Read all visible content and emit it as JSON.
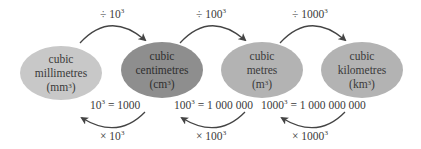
{
  "units": [
    {
      "id": "mm3",
      "line1": "cubic",
      "line2": "millimetres",
      "abbr": "mm",
      "exp": "3",
      "color": "#c8c8c8"
    },
    {
      "id": "cm3",
      "line1": "cubic",
      "line2": "centimetres",
      "abbr": "cm",
      "exp": "3",
      "color": "#8e8e8e"
    },
    {
      "id": "m3",
      "line1": "cubic",
      "line2": "metres",
      "abbr": "m",
      "exp": "3",
      "color": "#b3b3b3"
    },
    {
      "id": "km3",
      "line1": "cubic",
      "line2": "kilometres",
      "abbr": "km",
      "exp": "3",
      "color": "#b3b3b3"
    }
  ],
  "divide_labels": [
    {
      "op": "÷ 10",
      "exp": "3"
    },
    {
      "op": "÷ 100",
      "exp": "3"
    },
    {
      "op": "÷ 1000",
      "exp": "3"
    }
  ],
  "equalities": [
    {
      "base": "10",
      "exp": "3",
      "rhs": " = 1000"
    },
    {
      "base": "100",
      "exp": "3",
      "rhs": " = 1 000 000"
    },
    {
      "base": "1000",
      "exp": "3",
      "rhs": " = 1 000 000 000"
    }
  ],
  "multiply_labels": [
    {
      "op": "× 10",
      "exp": "3"
    },
    {
      "op": "× 100",
      "exp": "3"
    },
    {
      "op": "× 1000",
      "exp": "3"
    }
  ],
  "colors": {
    "arrow": "#444444",
    "text": "#3a3a3a"
  }
}
